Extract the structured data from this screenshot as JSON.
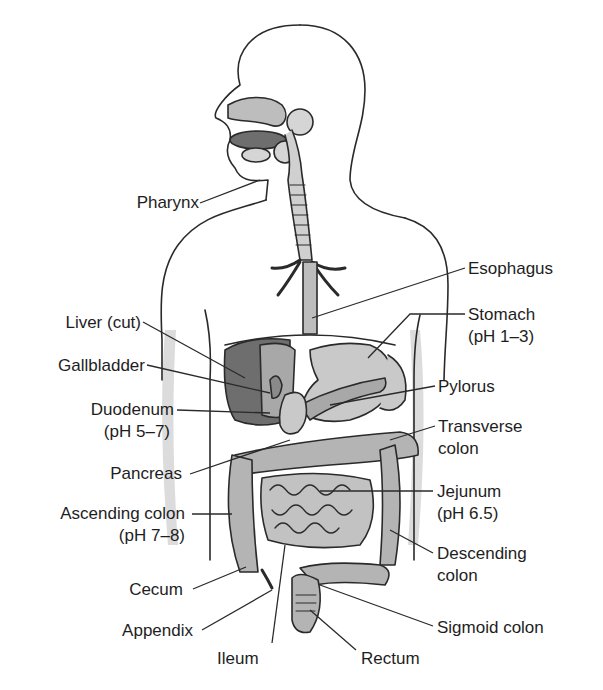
{
  "diagram": {
    "colors": {
      "background": "#ffffff",
      "outline": "#2a2a2a",
      "body_shadow": "#d9d9d9",
      "organ_light": "#c9c9c9",
      "organ_mid": "#a8a8a8",
      "organ_dark": "#6e6e6e",
      "leader_line": "#2a2a2a"
    },
    "labels": {
      "pharynx": "Pharynx",
      "esophagus": "Esophagus",
      "liver": "Liver (cut)",
      "stomach": "Stomach",
      "stomach_ph": "(pH 1–3)",
      "gallbladder": "Gallbladder",
      "pylorus": "Pylorus",
      "duodenum": "Duodenum",
      "duodenum_ph": "(pH 5–7)",
      "transverse_colon_1": "Transverse",
      "transverse_colon_2": "colon",
      "pancreas": "Pancreas",
      "jejunum": "Jejunum",
      "jejunum_ph": "(pH 6.5)",
      "ascending_colon": "Ascending colon",
      "ascending_colon_ph": "(pH 7–8)",
      "descending_colon_1": "Descending",
      "descending_colon_2": "colon",
      "cecum": "Cecum",
      "appendix": "Appendix",
      "sigmoid_colon": "Sigmoid colon",
      "ileum": "Ileum",
      "rectum": "Rectum"
    }
  }
}
